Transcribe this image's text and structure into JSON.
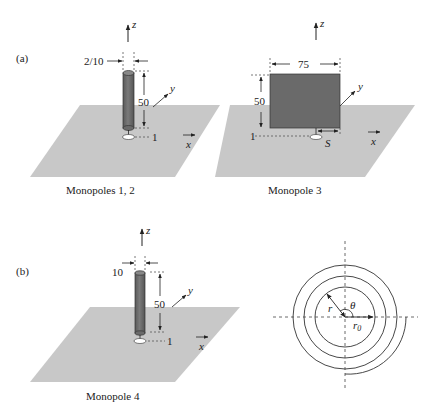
{
  "panels": {
    "a": {
      "tag": "(a)",
      "monopole12": {
        "caption": "Monopoles 1, 2",
        "diameter_label": "2/10",
        "height_label": "50",
        "gap_label": "1",
        "axes": {
          "z": "z",
          "y": "y",
          "x": "x"
        }
      },
      "monopole3": {
        "caption": "Monopole 3",
        "width_label": "75",
        "height_label": "50",
        "gap_label": "1",
        "offset_label": "S",
        "axes": {
          "z": "z",
          "y": "y",
          "x": "x"
        }
      }
    },
    "b": {
      "tag": "(b)",
      "monopole4": {
        "caption": "Monopole 4",
        "diameter_label": "10",
        "height_label": "50",
        "gap_label": "1",
        "axes": {
          "z": "z",
          "y": "y",
          "x": "x"
        }
      },
      "spiral": {
        "radius_label": "r",
        "angle_label": "θ",
        "r0_label": "r",
        "r0_sub": "0"
      }
    }
  },
  "colors": {
    "ground_plane": "#c8c8c8",
    "conductor": "#6e6e6e",
    "line": "#222222"
  }
}
